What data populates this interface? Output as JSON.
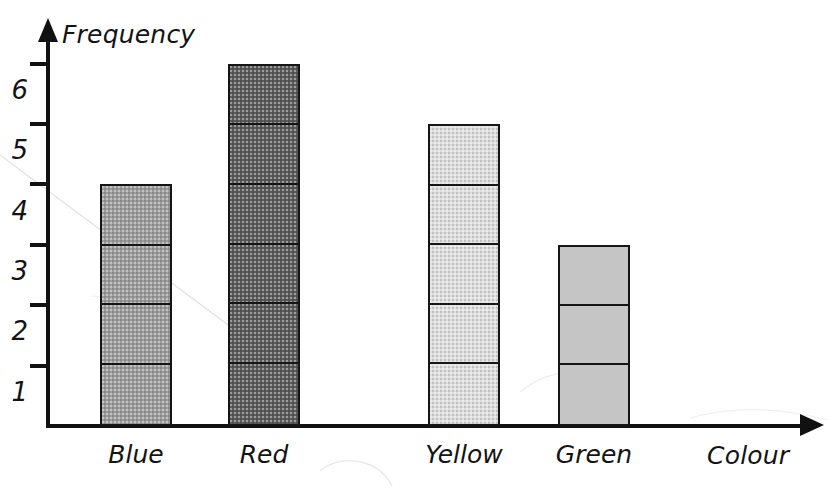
{
  "chart_data": {
    "type": "bar",
    "title": "",
    "xlabel": "Colour",
    "ylabel": "Frequency",
    "categories": [
      "Blue",
      "Red",
      "Yellow",
      "Green"
    ],
    "values": [
      4,
      6,
      5,
      3
    ],
    "ylim": [
      0,
      6.5
    ],
    "y_ticks": [
      1,
      2,
      3,
      4,
      5,
      6
    ],
    "y_tick_labels": [
      "1",
      "2",
      "3",
      "4",
      "5",
      "6"
    ],
    "grid": false,
    "legend": null,
    "bar_style": "stacked-unit-segments",
    "series": [
      {
        "name": "Frequency",
        "values": [
          4,
          6,
          5,
          3
        ]
      }
    ],
    "bars": [
      {
        "category": "Blue",
        "value": 4,
        "segments": 4,
        "fill": "#9b9b9b",
        "texture": "halftone-dots",
        "outline": "#151515"
      },
      {
        "category": "Red",
        "value": 6,
        "segments": 6,
        "fill": "#5a5a5a",
        "texture": "halftone-dots",
        "outline": "#151515"
      },
      {
        "category": "Yellow",
        "value": 5,
        "segments": 5,
        "fill": "#dedede",
        "texture": "halftone-dots",
        "outline": "#151515"
      },
      {
        "category": "Green",
        "value": 3,
        "segments": 3,
        "fill": "#c5c5c5",
        "texture": "flat",
        "outline": "#151515"
      }
    ],
    "axis_color": "#111111",
    "background_color": "#ffffff"
  },
  "axes": {
    "y_title": "Frequency",
    "x_title": "Colour",
    "y_labels": [
      "6",
      "5",
      "4",
      "3",
      "2",
      "1"
    ]
  },
  "x_labels": {
    "blue": "Blue",
    "red": "Red",
    "yellow": "Yellow",
    "green": "Green"
  }
}
